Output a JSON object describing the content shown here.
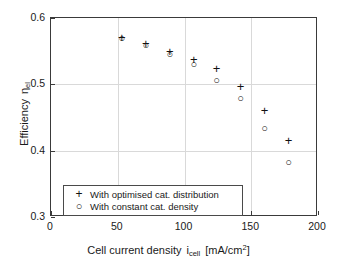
{
  "chart_data": {
    "type": "scatter",
    "title": "",
    "xlabel": "Cell current density i_cell [mA/cm^2]",
    "ylabel": "Efficiency eta_el",
    "xlim": [
      0,
      200
    ],
    "ylim": [
      0.3,
      0.6
    ],
    "xticks": [
      0,
      50,
      100,
      150,
      200
    ],
    "yticks": [
      0.3,
      0.4,
      0.5,
      0.6
    ],
    "xtick_labels": [
      "0",
      "50",
      "100",
      "150",
      "200"
    ],
    "ytick_labels": [
      "0.3",
      "0.4",
      "0.5",
      "0.6"
    ],
    "grid": true,
    "legend_position": "lower left",
    "x": [
      53,
      71,
      89,
      107,
      124,
      142,
      160,
      178
    ],
    "series": [
      {
        "name": "With optimised cat. distribution",
        "marker": "plus",
        "values": [
          0.572,
          0.562,
          0.551,
          0.538,
          0.524,
          0.498,
          0.462,
          0.416
        ]
      },
      {
        "name": "With constant cat. density",
        "marker": "circle",
        "values": [
          0.57,
          0.56,
          0.545,
          0.531,
          0.506,
          0.479,
          0.434,
          0.383
        ]
      }
    ]
  },
  "axis_titles": {
    "x_prefix": "Cell current density",
    "x_symbol": "i",
    "x_symbol_sub": "cell",
    "x_units_open": "[mA/cm",
    "x_units_sup": "2",
    "x_units_close": "]",
    "y_prefix": "Efficiency",
    "y_symbol": "η",
    "y_symbol_sub": "el"
  },
  "legend": {
    "items": [
      {
        "symbol": "+",
        "label": "With optimised cat. distribution"
      },
      {
        "symbol": "○",
        "label": "With constant cat. density"
      }
    ]
  },
  "markers": {
    "plus_glyph": "+",
    "circle_glyph": "○"
  },
  "colors": {
    "axis": "#3a3a3a",
    "grid": "#d9d9d9",
    "marker": "#111111",
    "background": "#ffffff"
  }
}
